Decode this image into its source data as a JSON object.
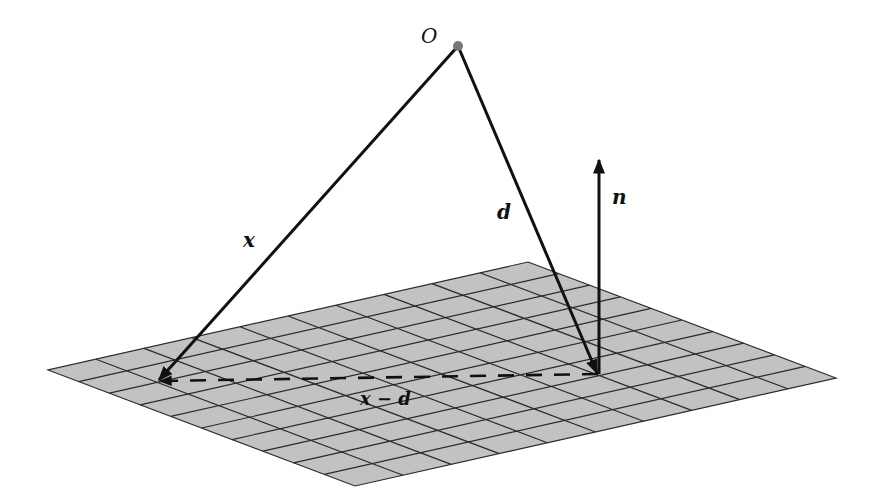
{
  "diagram": {
    "plane": {
      "grid_cells_u": 10,
      "grid_cells_v": 10,
      "fill_color": "#c2c2c2",
      "line_color": "#2a2a2a"
    },
    "origin": {
      "label": "O",
      "color": "#777777"
    },
    "vectors": [
      {
        "id": "x",
        "label": "x",
        "style": "solid"
      },
      {
        "id": "d",
        "label": "d",
        "style": "solid"
      },
      {
        "id": "n",
        "label": "n",
        "style": "solid"
      },
      {
        "id": "x_minus_d",
        "label": "x − d",
        "style": "dashed"
      }
    ],
    "colors": {
      "vector": "#111111",
      "background": "#ffffff"
    }
  }
}
